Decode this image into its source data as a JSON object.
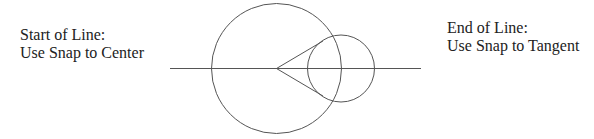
{
  "labels": {
    "start": {
      "line1": "Start of Line:",
      "line2": "Use Snap to Center"
    },
    "end": {
      "line1": "End of Line:",
      "line2": "Use Snap to Tangent"
    }
  },
  "geometry": {
    "stroke_color": "#555555",
    "horizontal_line": {
      "x1": 170,
      "y1": 68.5,
      "x2": 421,
      "y2": 68.5
    },
    "large_circle": {
      "cx": 276.5,
      "cy": 68.5,
      "r": 65
    },
    "small_circle": {
      "cx": 341,
      "cy": 68.5,
      "r": 33.5
    },
    "tangent_lines": [
      {
        "x1": 276.5,
        "y1": 68.5,
        "x2": 323,
        "y2": 41
      },
      {
        "x1": 276.5,
        "y1": 68.5,
        "x2": 323,
        "y2": 96
      }
    ]
  }
}
